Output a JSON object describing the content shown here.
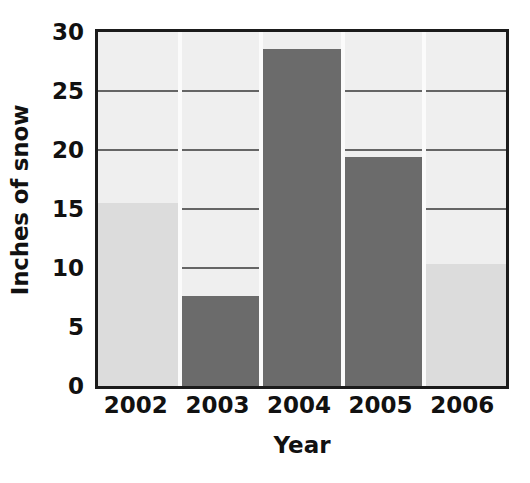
{
  "chart_data": {
    "type": "bar",
    "title": "",
    "xlabel": "Year",
    "ylabel": "Inches of snow",
    "categories": [
      "2002",
      "2003",
      "2004",
      "2005",
      "2006"
    ],
    "values": [
      15.5,
      7.6,
      28.6,
      19.4,
      10.3
    ],
    "series": [
      {
        "name": "Inches of snow",
        "values": [
          15.5,
          7.6,
          28.6,
          19.4,
          10.3
        ]
      }
    ],
    "ylim": [
      0,
      30
    ],
    "xlim_categorical": true,
    "ytick_labels": [
      "0",
      "5",
      "10",
      "15",
      "20",
      "25",
      "30"
    ],
    "ytick_values": [
      0,
      5,
      10,
      15,
      20,
      25,
      30
    ],
    "ytick_step": 5,
    "grid": {
      "horizontal": true,
      "vertical": false
    },
    "legend": {
      "visible": false,
      "position": "none"
    },
    "bar_colors": [
      "#dcdcdc",
      "#6b6b6b",
      "#6b6b6b",
      "#6b6b6b",
      "#dcdcdc"
    ],
    "annotations": []
  },
  "style": {
    "plot_background": "#efefef",
    "axis_border_color": "#1b1b1b",
    "gridline_color": "#4c4c4c",
    "bar_separator_color": "#fbfbfb",
    "light_bar_color": "#dcdcdc",
    "dark_bar_color": "#6b6b6b",
    "text_color": "#111111",
    "page_background": "#ffffff"
  }
}
